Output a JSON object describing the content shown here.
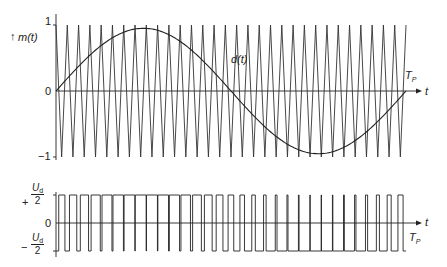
{
  "chart_data": [
    {
      "type": "line",
      "title": "Carrier triangle m(t) and modulating signal d(t)",
      "ylabel": "m(t)",
      "xlabel": "t",
      "period_label": "T_P",
      "ylim": [
        -1,
        1
      ],
      "yticks": [
        "1",
        "0",
        "-1"
      ],
      "series": [
        {
          "name": "m(t)",
          "kind": "triangle",
          "amplitude": 1,
          "cycles_per_TP": 31
        },
        {
          "name": "d(t)",
          "kind": "sine",
          "amplitude": 0.95,
          "cycles_per_TP": 1
        }
      ],
      "annotations": [
        "d(t)"
      ]
    },
    {
      "type": "line",
      "title": "PWM output voltage",
      "xlabel": "t",
      "period_label": "T_P",
      "levels": [
        "+Ud/2",
        "0",
        "-Ud/2"
      ],
      "series": [
        {
          "name": "u(t)",
          "kind": "pwm",
          "high": "+Ud/2",
          "low": "-Ud/2",
          "derived_from": "compare d(t) vs m(t)"
        }
      ]
    }
  ],
  "labels": {
    "top_y": "m(t)",
    "top_one": "1",
    "top_zero": "0",
    "top_minus_one": "−1",
    "d_label": "d(t)",
    "t_top": "t",
    "tp_top": "T",
    "tp_top_sub": "P",
    "bot_plus_sign": "+",
    "bot_minus_sign": "−",
    "bot_num": "U",
    "bot_num_sub": "d",
    "bot_den": "2",
    "bot_zero": "0",
    "t_bot": "t",
    "tp_bot": "T",
    "tp_bot_sub": "P"
  },
  "geometry": {
    "x0": 56,
    "x1": 406,
    "axis_end": 420,
    "top_y1": 25,
    "top_y0": 91,
    "top_ym1": 157,
    "bot_hi": 195,
    "bot_zero": 223,
    "bot_lo": 251,
    "teeth": 31,
    "sine_amp": 0.95
  },
  "colors": {
    "stroke": "#222222",
    "carrier": "#333333"
  }
}
